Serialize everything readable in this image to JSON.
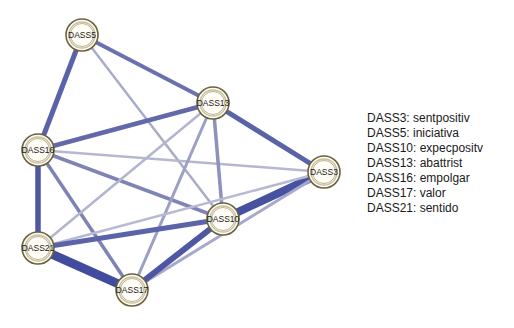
{
  "diagram": {
    "type": "network",
    "nodes": [
      {
        "id": "DASS5",
        "label": "DASS5",
        "x": 82,
        "y": 35
      },
      {
        "id": "DASS16",
        "label": "DASS16",
        "x": 38,
        "y": 150
      },
      {
        "id": "DASS13",
        "label": "DASS13",
        "x": 213,
        "y": 103
      },
      {
        "id": "DASS3",
        "label": "DASS3",
        "x": 324,
        "y": 172
      },
      {
        "id": "DASS10",
        "label": "DASS10",
        "x": 223,
        "y": 219
      },
      {
        "id": "DASS21",
        "label": "DASS21",
        "x": 38,
        "y": 248
      },
      {
        "id": "DASS17",
        "label": "DASS17",
        "x": 132,
        "y": 290
      }
    ],
    "edges": [
      {
        "from": "DASS5",
        "to": "DASS16",
        "width": 5,
        "color": "#5b63a8"
      },
      {
        "from": "DASS5",
        "to": "DASS13",
        "width": 4,
        "color": "#6b71ae"
      },
      {
        "from": "DASS5",
        "to": "DASS10",
        "width": 2.5,
        "color": "#a9acc9"
      },
      {
        "from": "DASS16",
        "to": "DASS13",
        "width": 4.5,
        "color": "#6268aa"
      },
      {
        "from": "DASS16",
        "to": "DASS3",
        "width": 2.5,
        "color": "#b6b8d2"
      },
      {
        "from": "DASS16",
        "to": "DASS10",
        "width": 3.5,
        "color": "#7f84b5"
      },
      {
        "from": "DASS16",
        "to": "DASS21",
        "width": 5.5,
        "color": "#4f58a4"
      },
      {
        "from": "DASS16",
        "to": "DASS17",
        "width": 3.5,
        "color": "#7e83b4"
      },
      {
        "from": "DASS13",
        "to": "DASS3",
        "width": 5,
        "color": "#5a62a8"
      },
      {
        "from": "DASS13",
        "to": "DASS10",
        "width": 3.5,
        "color": "#8d91bc"
      },
      {
        "from": "DASS13",
        "to": "DASS21",
        "width": 2.5,
        "color": "#b3b5d0"
      },
      {
        "from": "DASS13",
        "to": "DASS17",
        "width": 3,
        "color": "#9da0c5"
      },
      {
        "from": "DASS3",
        "to": "DASS10",
        "width": 8,
        "color": "#4651a0"
      },
      {
        "from": "DASS3",
        "to": "DASS21",
        "width": 2.5,
        "color": "#b8bad3"
      },
      {
        "from": "DASS3",
        "to": "DASS17",
        "width": 3,
        "color": "#a6a9cb"
      },
      {
        "from": "DASS10",
        "to": "DASS21",
        "width": 5,
        "color": "#5c64a9"
      },
      {
        "from": "DASS10",
        "to": "DASS17",
        "width": 6,
        "color": "#4d57a3"
      },
      {
        "from": "DASS21",
        "to": "DASS17",
        "width": 9,
        "color": "#414c9e"
      }
    ],
    "node_style": {
      "radius": 16,
      "fill": "#fffdf5",
      "outer_ring": "#6b6140",
      "inner_ring": "#c9c19a"
    }
  },
  "legend": {
    "items": [
      {
        "label": "DASS3: sentpositiv"
      },
      {
        "label": "DASS5: iniciativa"
      },
      {
        "label": "DASS10: expecpositv"
      },
      {
        "label": "DASS13: abattrist"
      },
      {
        "label": "DASS16: empolgar"
      },
      {
        "label": "DASS17: valor"
      },
      {
        "label": "DASS21: sentido"
      }
    ]
  }
}
